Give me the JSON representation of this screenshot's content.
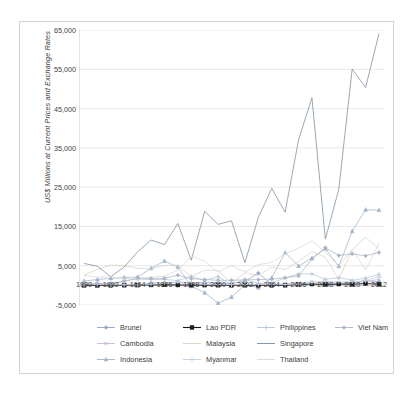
{
  "chart_data": {
    "type": "line",
    "title": "",
    "subtitle": "",
    "xlabel": "",
    "ylabel": "US$ Millions at Current Prices and Exchange Rates",
    "ylim": [
      -5000,
      65000
    ],
    "ytick_labels": [
      "65,000",
      "55,000",
      "45,000",
      "35,000",
      "25,000",
      "15,000",
      "5,000",
      "-5,000"
    ],
    "ytick_values": [
      65000,
      55000,
      45000,
      35000,
      25000,
      15000,
      5000,
      -5000
    ],
    "xlim": [
      1990,
      2012
    ],
    "x": [
      1990,
      1991,
      1992,
      1993,
      1994,
      1995,
      1996,
      1997,
      1998,
      1999,
      2000,
      2001,
      2002,
      2003,
      2004,
      2005,
      2006,
      2007,
      2008,
      2009,
      2010,
      2011,
      2012
    ],
    "xtick_labels": [
      "1990",
      "1992",
      "1994",
      "1996",
      "1998",
      "2000",
      "2002",
      "2004",
      "2006",
      "2008",
      "2010",
      "2012"
    ],
    "xtick_values": [
      1990,
      1992,
      1994,
      1996,
      1998,
      2000,
      2002,
      2004,
      2006,
      2008,
      2010,
      2012
    ],
    "grid": "horizontal",
    "legend_position": "bottom",
    "legend_columns": 4,
    "series": [
      {
        "name": "Brunei",
        "color": "#8ea4c8",
        "marker": "diamond",
        "values": [
          149,
          83,
          4,
          15,
          7,
          583,
          654,
          702,
          573,
          748,
          549,
          526,
          1035,
          3123,
          212,
          289,
          434,
          260,
          330,
          371,
          626,
          1208,
          865
        ]
      },
      {
        "name": "Cambodia",
        "color": "#c9b7d6",
        "marker": "x",
        "values": [
          0,
          0,
          33,
          54,
          69,
          151,
          294,
          168,
          243,
          232,
          149,
          149,
          145,
          84,
          131,
          381,
          483,
          867,
          815,
          539,
          783,
          892,
          1557
        ]
      },
      {
        "name": "Indonesia",
        "color": "#9fb4cc",
        "marker": "triangle",
        "values": [
          1093,
          1482,
          1777,
          2004,
          2109,
          4346,
          6194,
          4677,
          -241,
          -1866,
          -4550,
          -2977,
          145,
          -596,
          1896,
          8336,
          4914,
          6928,
          9318,
          4877,
          13771,
          19241,
          19138
        ]
      },
      {
        "name": "Lao PDR",
        "color": "#1a1a1a",
        "marker": "square",
        "values": [
          6,
          7,
          9,
          36,
          59,
          95,
          128,
          86,
          45,
          52,
          34,
          24,
          25,
          20,
          17,
          28,
          187,
          324,
          228,
          319,
          279,
          467,
          294
        ]
      },
      {
        "name": "Malaysia",
        "color": "#d9d2c2",
        "marker": "none",
        "values": [
          2611,
          4043,
          5183,
          5006,
          4342,
          4178,
          5078,
          5137,
          2163,
          3895,
          3788,
          554,
          3203,
          2473,
          4624,
          4065,
          6060,
          8595,
          7172,
          1453,
          9060,
          12198,
          9400
        ]
      },
      {
        "name": "Myanmar",
        "color": "#c4d0e0",
        "marker": "plus",
        "values": [
          225,
          238,
          172,
          149,
          126,
          318,
          581,
          879,
          684,
          304,
          208,
          192,
          191,
          291,
          251,
          236,
          276,
          715,
          976,
          963,
          901,
          1118,
          2243
        ]
      },
      {
        "name": "Philippines",
        "color": "#b9c6d8",
        "marker": "plus",
        "values": [
          550,
          556,
          228,
          1238,
          1591,
          1478,
          1517,
          1222,
          2287,
          1247,
          2240,
          195,
          1542,
          491,
          688,
          1854,
          2921,
          2916,
          1544,
          1963,
          1298,
          1816,
          2797
        ]
      },
      {
        "name": "Singapore",
        "color": "#7a8b9e",
        "marker": "none",
        "values": [
          5575,
          4887,
          2204,
          4686,
          8550,
          11535,
          10372,
          15753,
          6389,
          18850,
          15515,
          16429,
          5786,
          17273,
          24683,
          18636,
          37033,
          47733,
          11782,
          24427,
          55076,
          50365,
          64125
        ]
      },
      {
        "name": "Thailand",
        "color": "#d7d7d7",
        "marker": "none",
        "values": [
          2575,
          2049,
          2151,
          1807,
          1369,
          2070,
          2338,
          3882,
          7492,
          6091,
          3350,
          5073,
          3335,
          5235,
          5862,
          8048,
          9460,
          11330,
          8455,
          4854,
          9147,
          3894,
          10699
        ]
      },
      {
        "name": "Viet Nam",
        "color": "#aab4c4",
        "marker": "diamond",
        "values": [
          180,
          375,
          474,
          926,
          1945,
          1780,
          1803,
          2587,
          1700,
          1484,
          1289,
          1300,
          1400,
          1450,
          1610,
          1954,
          2400,
          6739,
          9579,
          7600,
          8000,
          7519,
          8368
        ]
      }
    ]
  },
  "legend": {
    "items": [
      {
        "label": "Brunei"
      },
      {
        "label": "Lao PDR"
      },
      {
        "label": "Philippines"
      },
      {
        "label": "Viet Nam"
      },
      {
        "label": "Cambodia"
      },
      {
        "label": "Malaysia"
      },
      {
        "label": "Singapore"
      },
      {
        "label": "Indonesia"
      },
      {
        "label": "Myanmar"
      },
      {
        "label": "Thailand"
      }
    ]
  }
}
